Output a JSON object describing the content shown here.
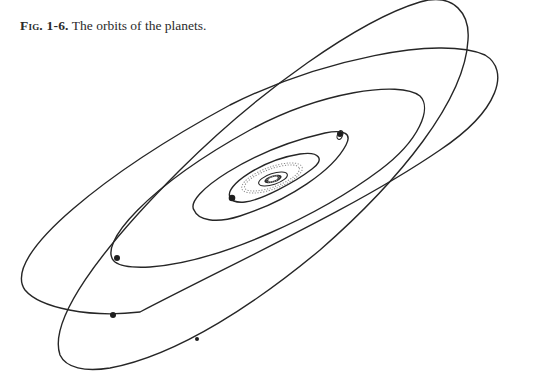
{
  "figure": {
    "caption_label": "Fig. 1-6.",
    "caption_text": " The orbits of the planets."
  },
  "diagram": {
    "type": "orbital-diagram",
    "center": "sun",
    "elements": [
      {
        "name": "sun-and-inner-planets",
        "description": "dense central cluster of small orbits"
      },
      {
        "name": "asteroid-belt",
        "style": "dotted ellipse"
      },
      {
        "name": "jupiter-orbit",
        "planet_marker": true
      },
      {
        "name": "saturn-orbit",
        "planet_marker": true,
        "ringed": true
      },
      {
        "name": "uranus-orbit",
        "planet_marker": true
      },
      {
        "name": "neptune-orbit",
        "planet_marker": true
      },
      {
        "name": "pluto-orbit",
        "planet_marker": true,
        "inclined": true
      }
    ],
    "colors": {
      "stroke": "#262626",
      "background": "#ffffff"
    }
  }
}
